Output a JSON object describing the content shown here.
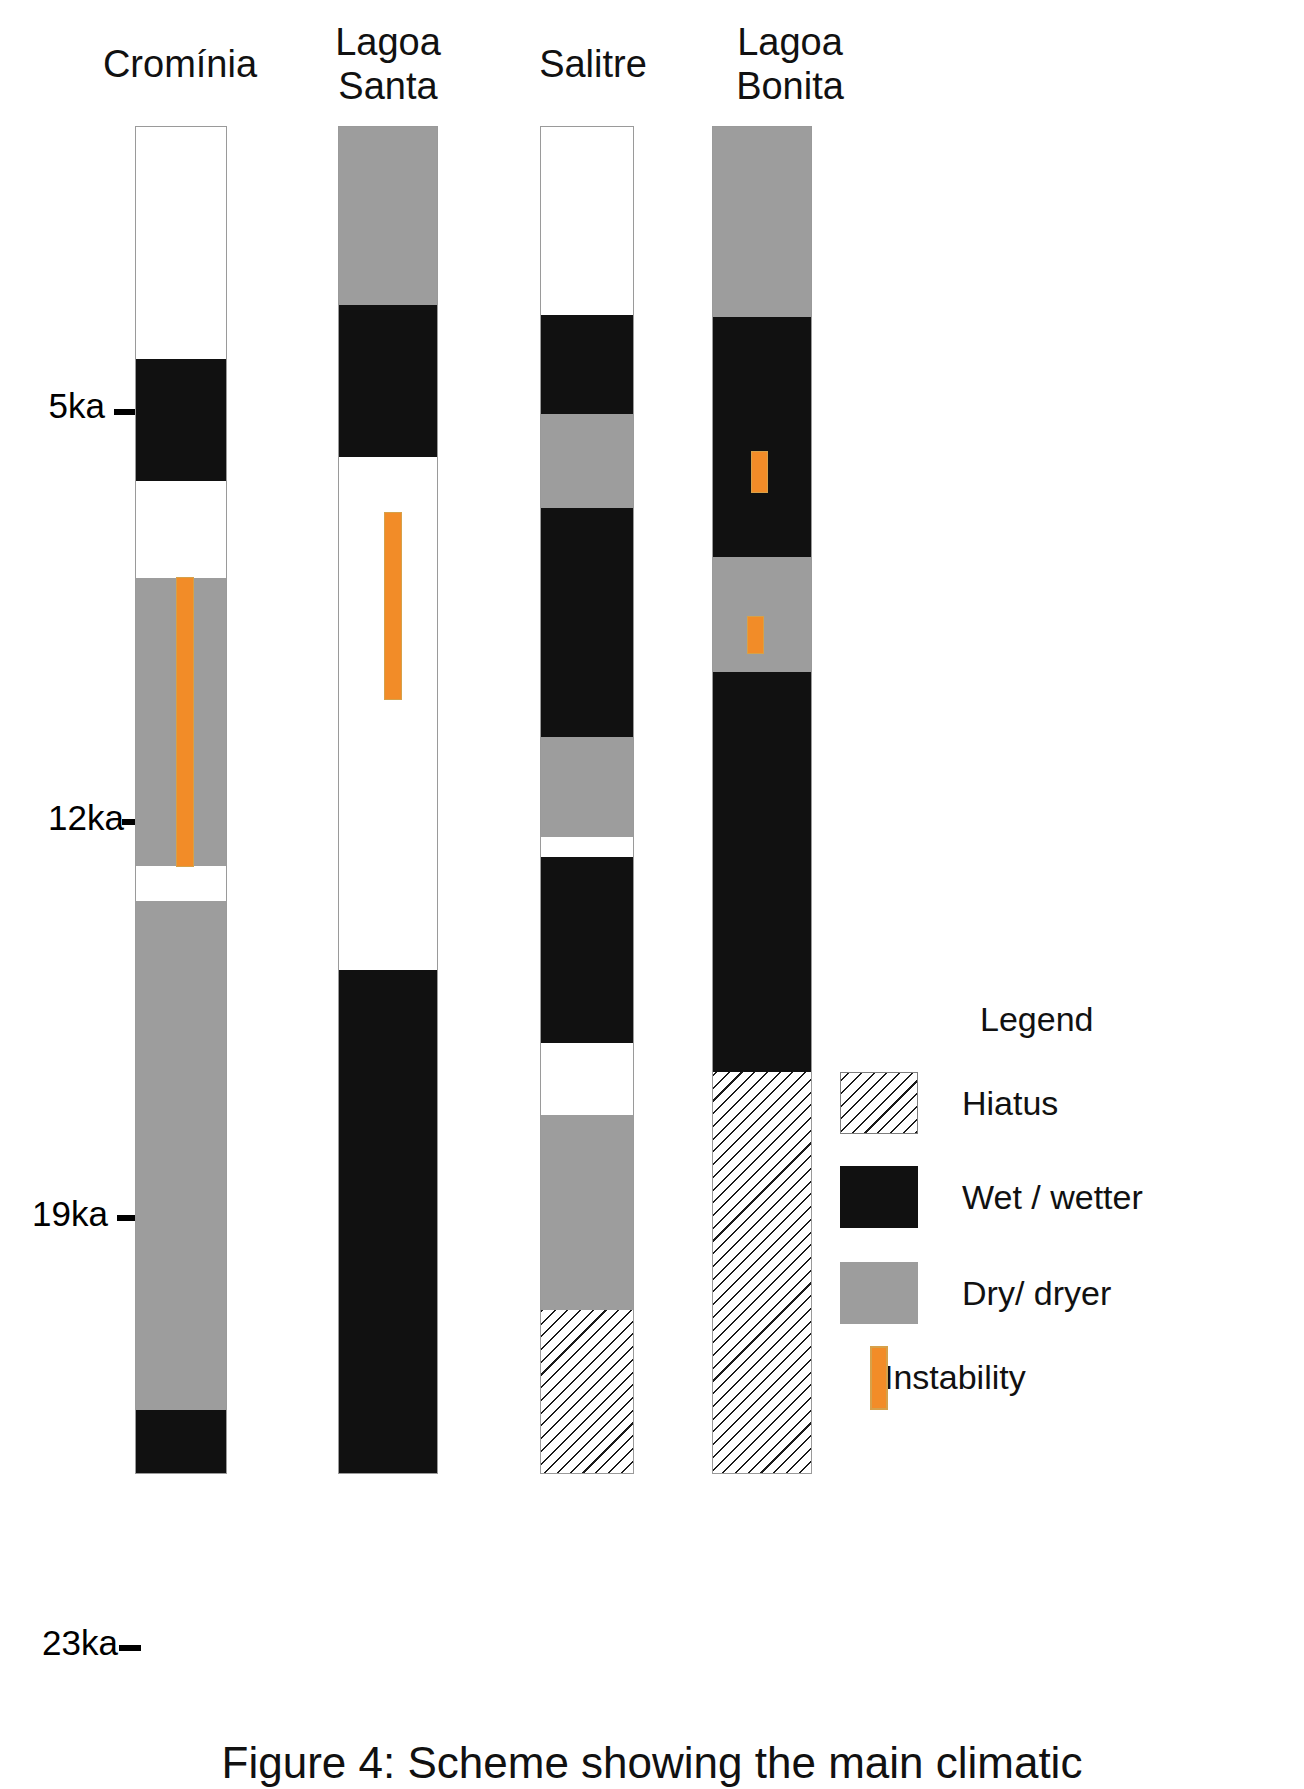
{
  "figure": {
    "caption": "Figure 4: Scheme showing the main climatic",
    "legend_title": "Legend"
  },
  "axis": {
    "ticks": [
      {
        "label": "5ka",
        "value": 5
      },
      {
        "label": "12ka",
        "value": 12
      },
      {
        "label": "19ka",
        "value": 19
      },
      {
        "label": "23ka",
        "value": 23
      }
    ]
  },
  "legend": {
    "items": [
      {
        "label": "Hiatus",
        "type": "hiatus",
        "color": "#ffffff"
      },
      {
        "label": "Wet / wetter",
        "type": "black",
        "color": "#111111"
      },
      {
        "label": "Dry/ dryer",
        "type": "gray",
        "color": "#9d9d9d"
      },
      {
        "label": "Instability",
        "type": "instability",
        "color": "#F28C28"
      }
    ]
  },
  "columns": [
    {
      "name": "Cromínia",
      "title": "Cromínia"
    },
    {
      "name": "Lagoa Santa",
      "title": "Lagoa\nSanta"
    },
    {
      "name": "Salitre",
      "title": "Salitre"
    },
    {
      "name": "Lagoa Bonita",
      "title": "Lagoa\nBonita"
    }
  ],
  "chart_data": {
    "type": "bar",
    "title": "Figure 4: Scheme showing the main climatic",
    "xlabel": "",
    "ylabel": "Age (ka BP)",
    "ylim": [
      0,
      24.5
    ],
    "axis_ticks": [
      5,
      12,
      19,
      23
    ],
    "axis_tick_labels": [
      "5ka",
      "12ka",
      "19ka",
      "23ka"
    ],
    "grid": false,
    "legend_position": "right",
    "legend_entries": [
      "Hiatus",
      "Wet / wetter",
      "Dry/ dryer",
      "Instability"
    ],
    "categories": [
      "Cromínia",
      "Lagoa Santa",
      "Salitre",
      "Lagoa Bonita"
    ],
    "series": [
      {
        "name": "Cromínia",
        "bands": [
          {
            "state": "white",
            "top_px": 0,
            "height_px": 232
          },
          {
            "state": "black",
            "top_px": 232,
            "height_px": 122
          },
          {
            "state": "white",
            "top_px": 354,
            "height_px": 97
          },
          {
            "state": "gray",
            "top_px": 451,
            "height_px": 288
          },
          {
            "state": "white",
            "top_px": 739,
            "height_px": 35
          },
          {
            "state": "gray",
            "top_px": 774,
            "height_px": 509
          },
          {
            "state": "black",
            "top_px": 1283,
            "height_px": 65
          }
        ],
        "instability": [
          {
            "top_px": 451,
            "height_px": 288,
            "x_frac": 0.46,
            "width_px": 16
          }
        ]
      },
      {
        "name": "Lagoa Santa",
        "bands": [
          {
            "state": "gray",
            "top_px": 0,
            "height_px": 178
          },
          {
            "state": "black",
            "top_px": 178,
            "height_px": 152
          },
          {
            "state": "white",
            "top_px": 330,
            "height_px": 513
          },
          {
            "state": "black",
            "top_px": 843,
            "height_px": 505
          }
        ],
        "instability": [
          {
            "top_px": 386,
            "height_px": 186,
            "x_frac": 0.47,
            "width_px": 16
          }
        ]
      },
      {
        "name": "Salitre",
        "bands": [
          {
            "state": "white",
            "top_px": 0,
            "height_px": 188
          },
          {
            "state": "black",
            "top_px": 188,
            "height_px": 99
          },
          {
            "state": "gray",
            "top_px": 287,
            "height_px": 94
          },
          {
            "state": "black",
            "top_px": 381,
            "height_px": 229
          },
          {
            "state": "gray",
            "top_px": 610,
            "height_px": 100
          },
          {
            "state": "white",
            "top_px": 710,
            "height_px": 20
          },
          {
            "state": "black",
            "top_px": 730,
            "height_px": 186
          },
          {
            "state": "white",
            "top_px": 916,
            "height_px": 72
          },
          {
            "state": "gray",
            "top_px": 988,
            "height_px": 195
          },
          {
            "state": "hiatus",
            "top_px": 1183,
            "height_px": 165
          }
        ],
        "instability": []
      },
      {
        "name": "Lagoa Bonita",
        "bands": [
          {
            "state": "gray",
            "top_px": 0,
            "height_px": 190
          },
          {
            "state": "black",
            "top_px": 190,
            "height_px": 240
          },
          {
            "state": "gray",
            "top_px": 430,
            "height_px": 115
          },
          {
            "state": "black",
            "top_px": 545,
            "height_px": 400
          },
          {
            "state": "hiatus",
            "top_px": 945,
            "height_px": 403
          }
        ],
        "instability": [
          {
            "top_px": 325,
            "height_px": 40,
            "x_frac": 0.4,
            "width_px": 15
          },
          {
            "top_px": 490,
            "height_px": 36,
            "x_frac": 0.36,
            "width_px": 15
          }
        ]
      }
    ]
  }
}
